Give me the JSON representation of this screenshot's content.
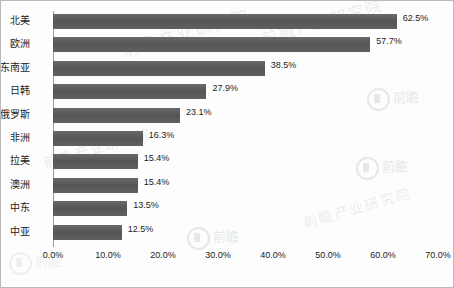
{
  "chart_data": {
    "type": "bar",
    "orientation": "horizontal",
    "title": "",
    "xlabel": "",
    "ylabel": "",
    "xlim": [
      0,
      70
    ],
    "xtick_step": 10,
    "grid": false,
    "legend": false,
    "value_suffix": "%",
    "categories": [
      "北美",
      "欧洲",
      "东南亚",
      "日韩",
      "俄罗斯",
      "非洲",
      "拉美",
      "澳洲",
      "中东",
      "中亚"
    ],
    "values": [
      62.5,
      57.7,
      38.5,
      27.9,
      23.1,
      16.3,
      15.4,
      15.4,
      13.5,
      12.5
    ],
    "value_labels": [
      "62.5%",
      "57.7%",
      "38.5%",
      "27.9%",
      "23.1%",
      "16.3%",
      "15.4%",
      "15.4%",
      "13.5%",
      "12.5%"
    ],
    "xtick_labels": [
      "0.0%",
      "10.0%",
      "20.0%",
      "30.0%",
      "40.0%",
      "50.0%",
      "60.0%",
      "70.0%"
    ],
    "xtick_values": [
      0,
      10,
      20,
      30,
      40,
      50,
      60,
      70
    ],
    "bar_color": "#5c5c5c",
    "axis_color": "#9b9b9b",
    "text_color": "#1c1c1c",
    "background": "#fdfdfd",
    "border_color": "#b9b9b9"
  },
  "watermarks": {
    "text_marks": [
      "前瞻产业研究院",
      "前瞻产业研究院",
      "前瞻产业研究院",
      "前瞻产业研究院"
    ],
    "logo_marks": [
      "前瞻",
      "前瞻",
      "前瞻",
      "前瞻"
    ]
  }
}
